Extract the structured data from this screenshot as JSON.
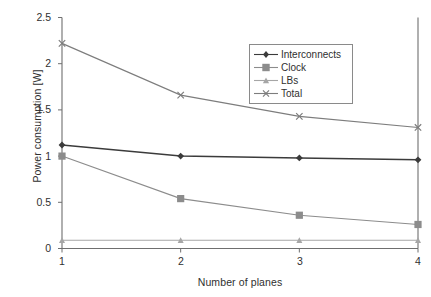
{
  "chart_data": {
    "type": "line",
    "title": "",
    "xlabel": "Number of planes",
    "ylabel": "Power consumption [W]",
    "x": [
      1,
      2,
      3,
      4
    ],
    "categories": [
      "1",
      "2",
      "3",
      "4"
    ],
    "xlim": [
      1,
      4
    ],
    "ylim": [
      0,
      2.5
    ],
    "xticks": [
      "1",
      "2",
      "3",
      "4"
    ],
    "yticks": [
      "0",
      "0.5",
      "1",
      "1.5",
      "2",
      "2.5"
    ],
    "ytick_values": [
      0,
      0.5,
      1,
      1.5,
      2,
      2.5
    ],
    "grid": false,
    "legend_position": "upper-right-inside",
    "series": [
      {
        "name": "Interconnects",
        "values": [
          1.12,
          1.0,
          0.98,
          0.96
        ],
        "color": "#3b3b3b",
        "marker": "diamond"
      },
      {
        "name": "Clock",
        "values": [
          1.0,
          0.54,
          0.36,
          0.26
        ],
        "color": "#8c8c8c",
        "marker": "square"
      },
      {
        "name": "LBs",
        "values": [
          0.09,
          0.09,
          0.09,
          0.09
        ],
        "color": "#a6a6a6",
        "marker": "triangle"
      },
      {
        "name": "Total",
        "values": [
          2.22,
          1.66,
          1.43,
          1.31
        ],
        "color": "#7d7d7d",
        "marker": "cross"
      }
    ]
  },
  "axes": {
    "ylabel": "Power consumption [W]",
    "xlabel": "Number of planes",
    "ytick_labels": [
      "2.5",
      "2",
      "1.5",
      "1",
      "0.5",
      "0"
    ],
    "xtick_labels": [
      "1",
      "2",
      "3",
      "4"
    ]
  },
  "legend": {
    "items": [
      {
        "label": "Interconnects"
      },
      {
        "label": "Clock"
      },
      {
        "label": "LBs"
      },
      {
        "label": "Total"
      }
    ]
  },
  "colors": {
    "axis": "#6f6f6f",
    "text": "#2f2f2f",
    "interconnects": "#3b3b3b",
    "clock": "#8c8c8c",
    "lbs": "#a6a6a6",
    "total": "#7d7d7d",
    "background": "#ffffff"
  }
}
